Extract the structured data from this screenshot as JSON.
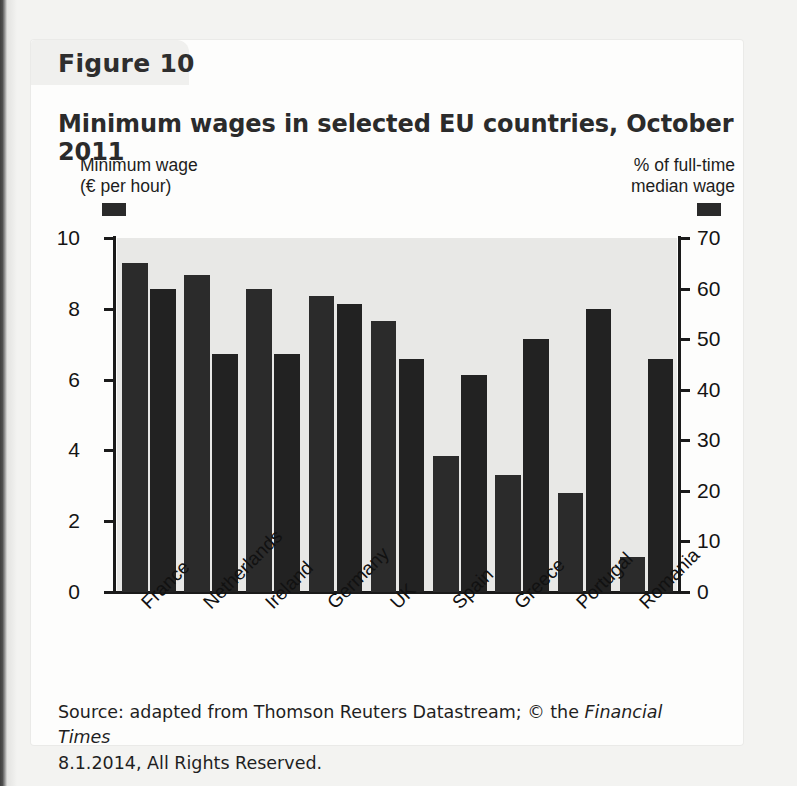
{
  "figure_label": "Figure 10",
  "title": "Minimum wages in selected EU countries, October 2011",
  "legend": {
    "left_line1": "Minimum wage",
    "left_line2": "(€ per hour)",
    "right_line1": "% of full-time",
    "right_line2": "median wage",
    "swatch_color": "#2a2a2a"
  },
  "caption": {
    "line1_pre": "Source: adapted from Thomson Reuters Datastream; © the ",
    "line1_italic": "Financial Times",
    "line2": "8.1.2014, All Rights Reserved."
  },
  "colors": {
    "bar": "#2b2b2b",
    "plot_background": "#e8e8e6",
    "card_background": "#fdfdfc",
    "page_background": "#f3f3f1",
    "axis": "#1a1a1a"
  },
  "chart_data": {
    "type": "bar",
    "title": "Minimum wages in selected EU countries, October 2011",
    "xlabel": "",
    "categories": [
      "France",
      "Netherlands",
      "Ireland",
      "Germany",
      "UK",
      "Spain",
      "Greece",
      "Portugal",
      "Romania"
    ],
    "series": [
      {
        "name": "Minimum wage (€ per hour)",
        "axis": "left",
        "ylabel": "Minimum wage (€ per hour)",
        "ylim": [
          0,
          10
        ],
        "yticks": [
          0,
          2,
          4,
          6,
          8,
          10
        ],
        "values": [
          9.3,
          8.95,
          8.55,
          8.35,
          7.65,
          3.85,
          3.3,
          2.8,
          1.0
        ]
      },
      {
        "name": "% of full-time median wage",
        "axis": "right",
        "ylabel": "% of full-time median wage",
        "ylim": [
          0,
          70
        ],
        "yticks": [
          0,
          10,
          20,
          30,
          40,
          50,
          60,
          70
        ],
        "values": [
          60,
          47,
          47,
          57,
          46,
          43,
          50,
          56,
          46
        ]
      }
    ],
    "grid": false,
    "legend_position": "top"
  }
}
